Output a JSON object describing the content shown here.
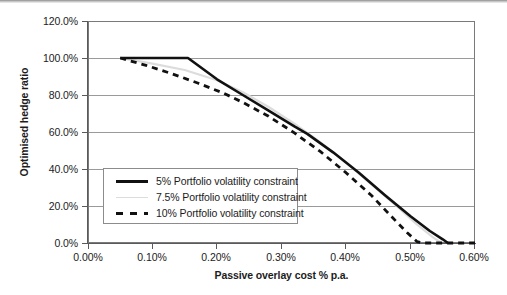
{
  "chart_data": {
    "type": "line",
    "title": "",
    "xlabel": "Passive overlay cost % p.a.",
    "ylabel": "Optimised hedge ratio",
    "xlim": [
      0.0,
      0.6
    ],
    "ylim": [
      0.0,
      120.0
    ],
    "x_tick_labels": [
      "0.00%",
      "0.10%",
      "0.20%",
      "0.30%",
      "0.40%",
      "0.50%",
      "0.60%"
    ],
    "x_tick_values": [
      0.0,
      0.1,
      0.2,
      0.3,
      0.4,
      0.5,
      0.6
    ],
    "y_tick_labels": [
      "0.0%",
      "20.0%",
      "40.0%",
      "60.0%",
      "80.0%",
      "100.0%",
      "120.0%"
    ],
    "y_tick_values": [
      0,
      20,
      40,
      60,
      80,
      100,
      120
    ],
    "grid": "horizontal",
    "legend_position": "inside-lower-left",
    "series": [
      {
        "name": "5% Portfolio volatility constraint",
        "style": "solid",
        "color": "#111111",
        "width": 2.6,
        "points": [
          [
            0.05,
            100.0
          ],
          [
            0.1,
            100.0
          ],
          [
            0.155,
            100.0
          ],
          [
            0.2,
            88.5
          ],
          [
            0.24,
            80.0
          ],
          [
            0.28,
            71.5
          ],
          [
            0.32,
            63.0
          ],
          [
            0.34,
            59.0
          ],
          [
            0.38,
            49.0
          ],
          [
            0.42,
            38.0
          ],
          [
            0.46,
            26.0
          ],
          [
            0.5,
            14.5
          ],
          [
            0.53,
            6.5
          ],
          [
            0.55,
            2.0
          ],
          [
            0.558,
            0.0
          ]
        ]
      },
      {
        "name": "7.5% Portfolio volatility constraint",
        "style": "solid",
        "color": "#dcdcdc",
        "width": 2.2,
        "points": [
          [
            0.05,
            100.0
          ],
          [
            0.1,
            97.0
          ],
          [
            0.15,
            93.5
          ],
          [
            0.2,
            88.0
          ],
          [
            0.24,
            81.5
          ],
          [
            0.28,
            73.5
          ],
          [
            0.32,
            64.5
          ],
          [
            0.36,
            54.5
          ],
          [
            0.4,
            43.5
          ],
          [
            0.44,
            31.5
          ],
          [
            0.48,
            19.5
          ],
          [
            0.51,
            10.0
          ],
          [
            0.535,
            3.0
          ],
          [
            0.548,
            0.0
          ]
        ]
      },
      {
        "name": "10% Portfolio volatility constraint",
        "style": "dashed",
        "color": "#111111",
        "width": 2.8,
        "points": [
          [
            0.05,
            100.0
          ],
          [
            0.09,
            96.0
          ],
          [
            0.13,
            91.5
          ],
          [
            0.17,
            86.5
          ],
          [
            0.21,
            81.0
          ],
          [
            0.24,
            76.0
          ],
          [
            0.28,
            68.5
          ],
          [
            0.32,
            59.5
          ],
          [
            0.36,
            49.5
          ],
          [
            0.4,
            38.0
          ],
          [
            0.44,
            25.5
          ],
          [
            0.47,
            14.5
          ],
          [
            0.495,
            5.5
          ],
          [
            0.51,
            0.8
          ],
          [
            0.52,
            0.0
          ],
          [
            0.6,
            0.0
          ]
        ]
      }
    ]
  },
  "axis": {
    "y_title": "Optimised hedge ratio",
    "x_title": "Passive overlay cost % p.a.",
    "y_labels": [
      "120.0%",
      "100.0%",
      "80.0%",
      "60.0%",
      "40.0%",
      "20.0%",
      "0.0%"
    ],
    "x_labels": [
      "0.00%",
      "0.10%",
      "0.20%",
      "0.30%",
      "0.40%",
      "0.50%",
      "0.60%"
    ]
  },
  "legend": {
    "entries": [
      {
        "label": "5% Portfolio volatility constraint",
        "key": "solid-black"
      },
      {
        "label": "7.5% Portfolio volatility constraint",
        "key": "solid-gray"
      },
      {
        "label": "10% Portfolio volatility constraint",
        "key": "dashed-black"
      }
    ]
  },
  "colors": {
    "series_5pct": "#111111",
    "series_75pct": "#dcdcdc",
    "series_10pct": "#111111",
    "gridline": "#9a9a9a",
    "axis": "#5a5a5a",
    "plot_border": "#7a7a7a",
    "text": "#1c1c1c",
    "background": "#ffffff"
  }
}
